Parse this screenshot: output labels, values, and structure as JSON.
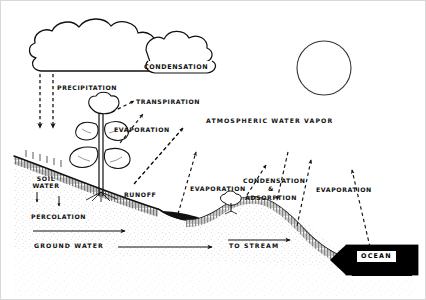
{
  "diagram": {
    "style": "black and white line drawing",
    "frame_color": "#cccccc",
    "ink_color": "#111111",
    "background_color": "#ffffff"
  },
  "labels": {
    "condensation_cloud": "CONDENSATION",
    "precipitation": "PRECIPITATION",
    "transpiration": "TRANSPIRATION",
    "evaporation_plant": "EVAPORATION",
    "atmospheric_water_vapor": "ATMOSPHERIC WATER VAPOR",
    "soil_water": "SOIL WATER",
    "runoff": "RUNOFF",
    "percolation": "PERCOLATION",
    "ground_water": "GROUND WATER",
    "evaporation_mid": "EVAPORATION",
    "condensation_adsorption": "CONDENSATION & ADSORPTION",
    "evaporation_right": "EVAPORATION",
    "to_stream": "TO STREAM",
    "ocean": "OCEAN"
  },
  "features": {
    "cloud": "cumulus-cloud",
    "second_cloud": "cumulus-cloud-small",
    "sun": "sun-circle",
    "plant": "large-plant",
    "bush": "small-bush",
    "ground": "ground-profile",
    "soil_layer": "soil-hatching",
    "subsurface": "stippled-subsurface",
    "stream_pool": "stream-pool",
    "ocean_body": "ocean-water"
  },
  "arrows": {
    "precipitation_left": "dashed-down-arrow",
    "precipitation_right": "dashed-down-arrow",
    "transpiration": "dashed-up-right-arrow",
    "evaporation_plant": "dashed-up-right-arrow",
    "evaporation_from_soil": "dashed-up-right-arrow",
    "runoff_downslope": "dashed-down-left-arrow",
    "evaporation_mid_up": "dashed-up-arrow",
    "condensation_down": "dashed-down-arrow",
    "adsorption_down": "dashed-down-arrow",
    "evaporation_stream_up": "dashed-up-arrow",
    "evaporation_ocean_up": "dashed-up-arrow",
    "percolation_flow": "solid-right-arrow",
    "ground_water_flow": "solid-right-arrow",
    "to_stream_flow": "solid-right-arrow",
    "soil_water_down_left": "small-down-arrow",
    "soil_water_down_right": "small-down-arrow"
  }
}
